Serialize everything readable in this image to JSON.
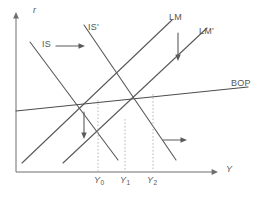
{
  "figure": {
    "axes": {
      "y_axis_label": "r",
      "x_axis_label": "Y",
      "origin": {
        "x": 16,
        "y": 172
      },
      "x_axis_end": {
        "x": 218,
        "y": 172
      },
      "y_axis_end": {
        "x": 16,
        "y": 14
      }
    },
    "curve_labels": {
      "is": "IS",
      "is_shifted": "IS'",
      "lm": "LM",
      "lm_shifted": "LM'",
      "bop": "BOP"
    },
    "tick_labels": [
      {
        "base": "Y",
        "sub": "0",
        "x": 102
      },
      {
        "base": "Y",
        "sub": "1",
        "x": 128
      },
      {
        "base": "Y",
        "sub": "2",
        "x": 155
      }
    ],
    "annotations": [
      {
        "name": "is-shift-arrow",
        "direction": "right",
        "meaning": "IS shifts right"
      },
      {
        "name": "lm-shift-arrow",
        "direction": "down",
        "meaning": "LM shifts down/right"
      },
      {
        "name": "interest-rate-fall-arrow",
        "direction": "down",
        "meaning": "interest rate falls"
      },
      {
        "name": "output-expansion-arrow",
        "direction": "right",
        "meaning": "output expands"
      }
    ],
    "colors": {
      "curve": "#595959",
      "axis": "#6e6e6e",
      "dropline": "#b0b0b0",
      "text": "#555555",
      "background": "#ffffff"
    }
  },
  "chart_data": {
    "type": "line",
    "xlabel": "Y",
    "ylabel": "r",
    "grid": false,
    "legend": "inline-curve-labels",
    "xlim": [
      16,
      218
    ],
    "ylim": [
      14,
      172
    ],
    "series": [
      {
        "name": "IS",
        "slope": "negative",
        "points": [
          [
            30,
            42
          ],
          [
            118,
            160
          ]
        ]
      },
      {
        "name": "IS'",
        "slope": "negative",
        "points": [
          [
            84,
            25
          ],
          [
            176,
            160
          ]
        ]
      },
      {
        "name": "LM",
        "slope": "positive",
        "points": [
          [
            22,
            163
          ],
          [
            172,
            20
          ]
        ]
      },
      {
        "name": "LM'",
        "slope": "positive",
        "points": [
          [
            63,
            163
          ],
          [
            207,
            28
          ]
        ]
      },
      {
        "name": "BOP",
        "slope": "slightly positive",
        "points": [
          [
            16,
            111
          ],
          [
            248,
            87
          ]
        ]
      }
    ],
    "equilibria": [
      {
        "name": "E0",
        "x": 98,
        "y": 101,
        "x_tick": "Y0",
        "description": "IS x LM initial equilibrium on BOP"
      },
      {
        "name": "E1",
        "x": 125,
        "y": 120,
        "x_tick": "Y1",
        "description": "IS x LM' intermediate point"
      },
      {
        "name": "E2",
        "x": 153,
        "y": 95,
        "x_tick": "Y2",
        "description": "IS' x LM' final equilibrium on BOP"
      }
    ],
    "droplines": [
      {
        "x": 98,
        "from_y": 101,
        "to_y": 172
      },
      {
        "x": 125,
        "from_y": 120,
        "to_y": 172
      },
      {
        "x": 153,
        "from_y": 95,
        "to_y": 172
      }
    ]
  }
}
